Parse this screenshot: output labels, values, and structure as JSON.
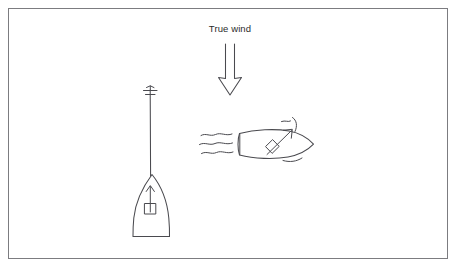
{
  "figure": {
    "background_color": "#ffffff",
    "stroke_color": "#4a4a4f",
    "border_color": "#7c7c80",
    "width": 456,
    "height": 267
  },
  "annotations": {
    "true_wind_label": "True wind"
  },
  "wind_arrow": {
    "name": "true-wind-arrow",
    "direction": "down",
    "from_x": 230,
    "from_y": 44,
    "to_x": 230,
    "to_y": 94,
    "shaft_half_width": 5,
    "head_half_width": 12,
    "head_length": 16
  },
  "boats": [
    {
      "name": "sailboat-head-to-wind",
      "orientation": "bow-up",
      "heading_degrees": 0,
      "hull": {
        "bow_x": 152,
        "bow_y": 174,
        "stern_y": 237,
        "half_beam": 17,
        "stern_half_beam": 11
      },
      "mast": {
        "x": 150,
        "top_y": 86,
        "bottom_y": 176
      },
      "masthead_fitting": "cross-vane",
      "heading_arrow": {
        "name": "boat-heading-arrow",
        "direction": "up",
        "from_x": 150,
        "from_y": 213,
        "to_x": 150,
        "to_y": 186,
        "base_box": true
      },
      "sails": "luffing",
      "wake": "none"
    },
    {
      "name": "sailboat-on-a-reach",
      "orientation": "bow-right",
      "heading_degrees": 90,
      "hull": {
        "bow_x": 313,
        "bow_y": 144,
        "stern_x": 239,
        "half_beam": 14,
        "stern_half_beam": 11
      },
      "apparent_wind_arrow": {
        "name": "apparent-wind-arrow",
        "direction": "up-right",
        "from_x": 265,
        "from_y": 156,
        "to_x": 292,
        "to_y": 130,
        "base_diamond": true
      },
      "sails": "drawing",
      "sail_curves": 2,
      "wake": {
        "name": "wake-lines",
        "line_count": 3,
        "side": "stern-left"
      }
    }
  ]
}
